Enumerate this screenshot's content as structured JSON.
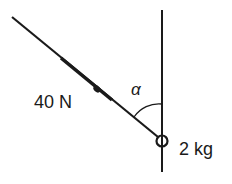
{
  "labels": {
    "force": "40 N",
    "angle": "α",
    "mass": "2 kg"
  },
  "colors": {
    "ink": "#1a1a1a",
    "background": "#ffffff"
  }
}
